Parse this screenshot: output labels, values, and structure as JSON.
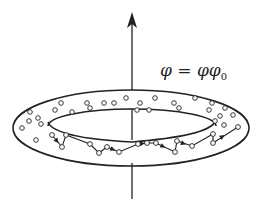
{
  "figure": {
    "label": {
      "lhs": "φ",
      "eq": " = ",
      "rhs_main": "φφ",
      "rhs_sub": "0"
    },
    "colors": {
      "stroke": "#222222",
      "background": "#ffffff"
    },
    "axis": {
      "x": 132,
      "top_y": 12,
      "upper_end_y": 98,
      "lower_start_y": 163,
      "bottom_y": 199
    },
    "torus": {
      "outer": {
        "cx": 131,
        "cy": 128,
        "rx": 118,
        "ry": 38
      },
      "inner_top": {
        "cx": 132,
        "cy": 126,
        "rx": 84,
        "ry": 17
      },
      "inner_bottom_arc_start": [
        48,
        128
      ],
      "inner_bottom_arc_end": [
        215,
        126
      ]
    },
    "scattered_particles": [
      [
        61,
        103
      ],
      [
        87,
        103
      ],
      [
        104,
        103
      ],
      [
        126,
        98
      ],
      [
        140,
        103
      ],
      [
        155,
        98
      ],
      [
        174,
        103
      ],
      [
        195,
        98
      ],
      [
        212,
        103
      ],
      [
        225,
        108
      ],
      [
        30,
        112
      ],
      [
        38,
        118
      ],
      [
        55,
        110
      ],
      [
        72,
        112
      ],
      [
        90,
        108
      ],
      [
        114,
        103
      ],
      [
        137,
        110
      ],
      [
        149,
        110
      ],
      [
        179,
        108
      ],
      [
        209,
        110
      ],
      [
        220,
        116
      ],
      [
        233,
        115
      ],
      [
        22,
        128
      ],
      [
        29,
        121
      ],
      [
        41,
        124
      ],
      [
        36,
        140
      ],
      [
        215,
        121
      ],
      [
        224,
        125
      ]
    ],
    "chain_points": [
      [
        52,
        135
      ],
      [
        62,
        147
      ],
      [
        66,
        135
      ],
      [
        90,
        144
      ],
      [
        99,
        153
      ],
      [
        107,
        147
      ],
      [
        119,
        152
      ],
      [
        138,
        144
      ],
      [
        147,
        143
      ],
      [
        156,
        143
      ],
      [
        175,
        152
      ],
      [
        177,
        141
      ],
      [
        192,
        146
      ],
      [
        213,
        134
      ],
      [
        213,
        143
      ],
      [
        238,
        127
      ]
    ],
    "chain_arrows": [
      [
        [
          52,
          135
        ],
        [
          62,
          147
        ]
      ],
      [
        [
          107,
          147
        ],
        [
          119,
          152
        ]
      ],
      [
        [
          138,
          144
        ],
        [
          147,
          143
        ]
      ],
      [
        [
          156,
          143
        ],
        [
          170,
          150
        ]
      ],
      [
        [
          177,
          141
        ],
        [
          190,
          146
        ]
      ],
      [
        [
          213,
          143
        ],
        [
          232,
          130
        ]
      ]
    ]
  }
}
